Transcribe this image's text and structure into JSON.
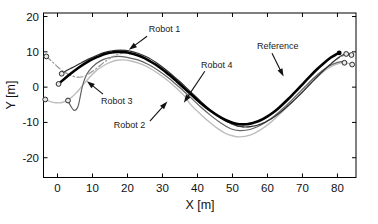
{
  "figure": {
    "background": "#ffffff",
    "type_note": "MATLAB-style trajectory plot, grayscale"
  },
  "chart_data": {
    "type": "line",
    "title": "",
    "xlabel": "X [m]",
    "ylabel": "Y [m]",
    "xlim": [
      -4.0,
      85.3
    ],
    "ylim": [
      -25.6,
      21.0
    ],
    "x_ticks": [
      0,
      10,
      20,
      30,
      40,
      50,
      60,
      70,
      80
    ],
    "y_ticks": [
      20,
      10,
      0,
      -10,
      -20
    ],
    "grid": false,
    "box": true,
    "legend_position": "none-inline-annotations",
    "axis_color": "#000000",
    "series": [
      {
        "name": "Robot 2",
        "color": "#bdbdbd",
        "width": 1.4,
        "dash": "",
        "points": [
          [
            -3.5,
            -3.5
          ],
          [
            -2,
            -4.1
          ],
          [
            -0.5,
            -4.4
          ],
          [
            1,
            -4.4
          ],
          [
            2.5,
            -3.9
          ],
          [
            4,
            -2.9
          ],
          [
            5.5,
            -1.5
          ],
          [
            7,
            0.3
          ],
          [
            9,
            2.6
          ],
          [
            11,
            4.6
          ],
          [
            13,
            6.0
          ],
          [
            15,
            7.0
          ],
          [
            17,
            7.6
          ],
          [
            19,
            7.7
          ],
          [
            21,
            7.4
          ],
          [
            24,
            6.5
          ],
          [
            27,
            5.0
          ],
          [
            30,
            3.0
          ],
          [
            33,
            0.6
          ],
          [
            36,
            -2.2
          ],
          [
            38,
            -4.9
          ],
          [
            41,
            -7.8
          ],
          [
            44,
            -10.4
          ],
          [
            46,
            -11.9
          ],
          [
            48,
            -13.1
          ],
          [
            50,
            -13.8
          ],
          [
            52,
            -14.1
          ],
          [
            55,
            -13.6
          ],
          [
            58,
            -12.1
          ],
          [
            61,
            -9.9
          ],
          [
            64,
            -7.2
          ],
          [
            67,
            -4.2
          ],
          [
            70,
            -1.1
          ],
          [
            73,
            1.9
          ],
          [
            76,
            4.4
          ],
          [
            78,
            5.7
          ],
          [
            80,
            6.6
          ],
          [
            82,
            7.0
          ],
          [
            84.2,
            6.4
          ]
        ],
        "markers": [
          {
            "x": -3.5,
            "y": -3.5,
            "style": "open"
          },
          {
            "x": 84.2,
            "y": 6.4,
            "style": "open"
          }
        ]
      },
      {
        "name": "Robot 3",
        "color": "#636363",
        "width": 1.2,
        "dash": "",
        "points": [
          [
            3,
            -3.8
          ],
          [
            3.8,
            -5.4
          ],
          [
            4.8,
            -6.6
          ],
          [
            5.8,
            -5.6
          ],
          [
            6.4,
            -3.2
          ],
          [
            7,
            -0.2
          ],
          [
            7.8,
            2.4
          ],
          [
            9,
            4.6
          ],
          [
            11,
            6.6
          ],
          [
            13,
            7.8
          ],
          [
            15,
            8.4
          ],
          [
            17.5,
            8.7
          ],
          [
            20,
            8.4
          ],
          [
            23,
            7.7
          ],
          [
            26,
            6.4
          ],
          [
            29,
            4.6
          ],
          [
            32,
            2.4
          ],
          [
            35,
            -0.2
          ],
          [
            38,
            -2.9
          ],
          [
            41,
            -5.7
          ],
          [
            44,
            -8.2
          ],
          [
            47,
            -10.4
          ],
          [
            49.5,
            -11.8
          ],
          [
            52,
            -12.3
          ],
          [
            55,
            -12.0
          ],
          [
            58,
            -10.8
          ],
          [
            61,
            -8.9
          ],
          [
            64,
            -6.4
          ],
          [
            67,
            -3.6
          ],
          [
            70,
            -0.6
          ],
          [
            73,
            2.4
          ],
          [
            76,
            4.9
          ],
          [
            78.5,
            6.4
          ],
          [
            81,
            7.2
          ],
          [
            82,
            6.9
          ]
        ],
        "markers": [
          {
            "x": 3,
            "y": -3.8,
            "style": "open"
          },
          {
            "x": 82,
            "y": 6.9,
            "style": "open"
          }
        ]
      },
      {
        "name": "Robot 4",
        "color": "#969696",
        "width": 1.2,
        "dash": "6,2.5,1.5,2.5",
        "points": [
          [
            -3.2,
            8.7
          ],
          [
            -1.5,
            7.2
          ],
          [
            0,
            5.8
          ],
          [
            1.5,
            4.6
          ],
          [
            3,
            3.7
          ],
          [
            4.5,
            3.1
          ],
          [
            6,
            2.8
          ],
          [
            7.5,
            3.0
          ],
          [
            9,
            3.8
          ],
          [
            11,
            5.2
          ],
          [
            13,
            6.8
          ],
          [
            15,
            8.2
          ],
          [
            17,
            9.2
          ],
          [
            19,
            9.6
          ],
          [
            21,
            9.4
          ],
          [
            24,
            8.6
          ],
          [
            27,
            7.2
          ],
          [
            30,
            5.2
          ],
          [
            33,
            2.8
          ],
          [
            36,
            0.1
          ],
          [
            39,
            -2.7
          ],
          [
            42,
            -5.3
          ],
          [
            45,
            -7.7
          ],
          [
            48,
            -9.6
          ],
          [
            51,
            -10.9
          ],
          [
            54,
            -11.3
          ],
          [
            57,
            -10.8
          ],
          [
            60,
            -9.5
          ],
          [
            63,
            -7.6
          ],
          [
            66,
            -5.1
          ],
          [
            69,
            -2.3
          ],
          [
            72,
            0.7
          ],
          [
            75,
            3.7
          ],
          [
            78,
            6.5
          ],
          [
            80,
            8.0
          ],
          [
            82,
            9.0
          ],
          [
            84,
            9.1
          ]
        ],
        "markers": [
          {
            "x": -3.2,
            "y": 8.7,
            "style": "open"
          },
          {
            "x": 84,
            "y": 9.1,
            "style": "open"
          }
        ]
      },
      {
        "name": "Robot 1",
        "color": "#2f2f2f",
        "width": 1.2,
        "dash": "",
        "points": [
          [
            1.2,
            3.8
          ],
          [
            3,
            4.9
          ],
          [
            5,
            5.9
          ],
          [
            7,
            7.0
          ],
          [
            9,
            8.0
          ],
          [
            11,
            8.9
          ],
          [
            13,
            9.7
          ],
          [
            15.5,
            10.3
          ],
          [
            18,
            10.5
          ],
          [
            20.5,
            10.3
          ],
          [
            23,
            9.6
          ],
          [
            26,
            8.3
          ],
          [
            29,
            6.4
          ],
          [
            32,
            4.1
          ],
          [
            35,
            1.5
          ],
          [
            38,
            -1.3
          ],
          [
            41,
            -4.1
          ],
          [
            44,
            -6.7
          ],
          [
            47,
            -8.9
          ],
          [
            50,
            -10.5
          ],
          [
            52.5,
            -11.2
          ],
          [
            55,
            -11.2
          ],
          [
            58,
            -10.5
          ],
          [
            61,
            -9.0
          ],
          [
            64,
            -6.9
          ],
          [
            67,
            -4.3
          ],
          [
            70,
            -1.4
          ],
          [
            73,
            1.7
          ],
          [
            76,
            4.7
          ],
          [
            78,
            6.5
          ],
          [
            80,
            8.2
          ],
          [
            81.5,
            9.1
          ],
          [
            82.5,
            9.4
          ]
        ],
        "markers": [
          {
            "x": 1.2,
            "y": 3.8,
            "style": "open"
          },
          {
            "x": 82.5,
            "y": 9.4,
            "style": "open"
          }
        ]
      },
      {
        "name": "Reference",
        "color": "#000000",
        "width": 2.6,
        "dash": "",
        "points": [
          [
            0.3,
            0.9
          ],
          [
            2,
            2.4
          ],
          [
            4,
            4.0
          ],
          [
            6,
            5.5
          ],
          [
            8,
            6.8
          ],
          [
            10,
            7.9
          ],
          [
            12,
            8.8
          ],
          [
            14,
            9.5
          ],
          [
            16,
            9.9
          ],
          [
            18,
            10.0
          ],
          [
            20,
            9.8
          ],
          [
            22,
            9.3
          ],
          [
            24,
            8.6
          ],
          [
            26,
            7.6
          ],
          [
            28,
            6.4
          ],
          [
            30,
            5.0
          ],
          [
            32,
            3.4
          ],
          [
            34,
            1.7
          ],
          [
            36,
            -0.1
          ],
          [
            38,
            -1.9
          ],
          [
            40,
            -3.7
          ],
          [
            42,
            -5.4
          ],
          [
            44,
            -6.9
          ],
          [
            46,
            -8.2
          ],
          [
            48,
            -9.3
          ],
          [
            50,
            -10.1
          ],
          [
            52,
            -10.5
          ],
          [
            54,
            -10.5
          ],
          [
            56,
            -10.1
          ],
          [
            58,
            -9.4
          ],
          [
            60,
            -8.3
          ],
          [
            62,
            -6.9
          ],
          [
            64,
            -5.2
          ],
          [
            66,
            -3.3
          ],
          [
            68,
            -1.3
          ],
          [
            70,
            0.8
          ],
          [
            72,
            2.9
          ],
          [
            74,
            4.9
          ],
          [
            76,
            6.7
          ],
          [
            78,
            8.3
          ],
          [
            79.5,
            9.2
          ],
          [
            80.5,
            9.7
          ]
        ],
        "markers": [
          {
            "x": 0.3,
            "y": 0.9,
            "style": "open"
          },
          {
            "x": 80.5,
            "y": 9.7,
            "style": "filled"
          }
        ]
      }
    ],
    "annotations": [
      {
        "label": "Robot 1",
        "text_xy": [
          26.1,
          17.8
        ],
        "arrow_from": [
          25.6,
          14.4
        ],
        "arrow_to": [
          20.4,
          10.6
        ]
      },
      {
        "label": "Robot 4",
        "text_xy": [
          41.0,
          7.6
        ],
        "arrow_from": [
          42.1,
          4.5
        ],
        "arrow_to": [
          36.1,
          -4.4
        ]
      },
      {
        "label": "Reference",
        "text_xy": [
          57.0,
          13.0
        ],
        "arrow_from": [
          61.3,
          9.6
        ],
        "arrow_to": [
          64.6,
          3.0
        ]
      },
      {
        "label": "Robot 3",
        "text_xy": [
          12.4,
          -2.5
        ],
        "arrow_from": [
          13.0,
          -2.0
        ],
        "arrow_to": [
          8.4,
          1.7
        ]
      },
      {
        "label": "Robot 2",
        "text_xy": [
          16.1,
          -9.3
        ],
        "arrow_from": [
          26.4,
          -9.6
        ],
        "arrow_to": [
          31.4,
          -4.1
        ]
      }
    ],
    "marker_style": {
      "open_fill": "#e8e8e8",
      "open_stroke": "#2a2a2a",
      "filled_fill": "#000000",
      "radius": 2.4
    }
  }
}
